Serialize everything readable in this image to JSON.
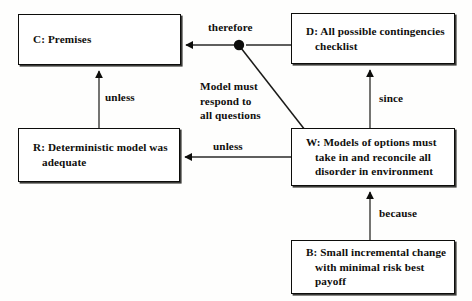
{
  "diagram": {
    "canvas": {
      "width": 472,
      "height": 301,
      "background": "#fefefd"
    },
    "stroke_color": "#0d0d0b",
    "nodes": [
      {
        "id": "C",
        "name": "premises",
        "text": "C: Premises",
        "x": 18,
        "y": 14,
        "w": 163,
        "h": 51,
        "align": "left"
      },
      {
        "id": "D",
        "name": "contingencies-checklist",
        "text": "D: All possible contingencies\nchecklist",
        "x": 291,
        "y": 13,
        "w": 164,
        "h": 51,
        "align": "left"
      },
      {
        "id": "R",
        "name": "deterministic-model",
        "text": "R: Deterministic model was\nadequate",
        "x": 18,
        "y": 128,
        "w": 162,
        "h": 54,
        "align": "left"
      },
      {
        "id": "W",
        "name": "models-of-options",
        "text": "W: Models of options must\ntake in and reconcile all\ndisorder in environment",
        "x": 291,
        "y": 128,
        "w": 164,
        "h": 58,
        "align": "left"
      },
      {
        "id": "B",
        "name": "incremental-change",
        "text": "B: Small incremental change\nwith minimal risk best\npayoff",
        "x": 291,
        "y": 240,
        "w": 164,
        "h": 54,
        "align": "left"
      }
    ],
    "labels": [
      {
        "id": "therefore",
        "name": "edge-label-therefore",
        "text": "therefore",
        "x": 208,
        "y": 20
      },
      {
        "id": "unless_r_c",
        "name": "edge-label-unless-r-to-c",
        "text": "unless",
        "x": 105,
        "y": 90
      },
      {
        "id": "model_must",
        "name": "edge-label-model-must-respond",
        "text": "Model must\nrespond to\nall questions",
        "x": 200,
        "y": 79
      },
      {
        "id": "unless_w_r",
        "name": "edge-label-unless-w-to-r",
        "text": "unless",
        "x": 213,
        "y": 139
      },
      {
        "id": "since",
        "name": "edge-label-since",
        "text": "since",
        "x": 379,
        "y": 91
      },
      {
        "id": "because",
        "name": "edge-label-because",
        "text": "because",
        "x": 379,
        "y": 206
      }
    ],
    "edges": [
      {
        "id": "d_to_c",
        "name": "edge-d-to-c",
        "from": "D",
        "to": "C",
        "label": "therefore",
        "kind": "arrow-horizontal"
      },
      {
        "id": "w_to_junction",
        "name": "edge-w-to-junction",
        "from": "W",
        "to": "junction",
        "label": "Model must respond to all questions",
        "kind": "diagonal"
      },
      {
        "id": "r_to_c",
        "name": "edge-r-to-c",
        "from": "R",
        "to": "C",
        "label": "unless",
        "kind": "arrow-vertical"
      },
      {
        "id": "w_to_r",
        "name": "edge-w-to-r",
        "from": "W",
        "to": "R",
        "label": "unless",
        "kind": "arrow-horizontal"
      },
      {
        "id": "w_to_d",
        "name": "edge-w-to-d",
        "from": "W",
        "to": "D",
        "label": "since",
        "kind": "arrow-vertical"
      },
      {
        "id": "b_to_w",
        "name": "edge-b-to-w",
        "from": "B",
        "to": "W",
        "label": "because",
        "kind": "arrow-vertical"
      }
    ],
    "junction": {
      "name": "junction-dot",
      "x": 239,
      "y": 45,
      "r": 5.2
    }
  }
}
